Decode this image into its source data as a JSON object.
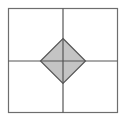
{
  "diagram": {
    "colors": {
      "background": "#ffffff",
      "frame_stroke": "#6e6e6e",
      "axis_stroke": "#555555",
      "diamond_fill": "#c4c4c4",
      "diamond_stroke": "#555555"
    },
    "elements": [
      {
        "name": "outer-square",
        "kind": "square"
      },
      {
        "name": "vertical-divider",
        "kind": "line"
      },
      {
        "name": "horizontal-divider",
        "kind": "line"
      },
      {
        "name": "center-diamond",
        "kind": "diamond"
      }
    ]
  }
}
